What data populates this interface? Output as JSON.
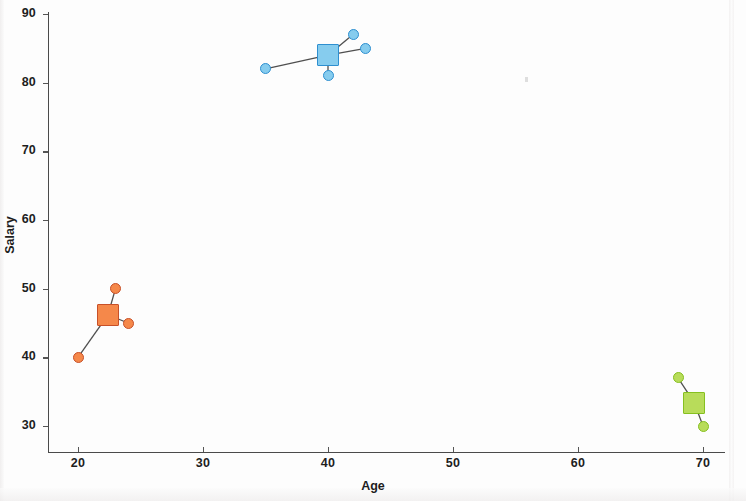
{
  "chart_data": {
    "type": "scatter",
    "title": "",
    "xlabel": "Age",
    "ylabel": "Salary",
    "xlim": [
      17.6,
      72.2
    ],
    "ylim": [
      28.0,
      90.9
    ],
    "xticks": [
      20,
      30,
      40,
      50,
      60,
      70
    ],
    "yticks": [
      30,
      40,
      50,
      60,
      70,
      80,
      90
    ],
    "grid": false,
    "legend": null,
    "series": [
      {
        "name": "cluster-orange",
        "color": "#F5884A",
        "edge_color": "#C85028",
        "points": [
          {
            "x": 20,
            "y": 40
          },
          {
            "x": 23,
            "y": 50
          },
          {
            "x": 24,
            "y": 45
          }
        ],
        "centroid": {
          "x": 22.4,
          "y": 46.2
        }
      },
      {
        "name": "cluster-blue",
        "color": "#86CCEE",
        "edge_color": "#2E8FD0",
        "points": [
          {
            "x": 35,
            "y": 82
          },
          {
            "x": 40,
            "y": 81
          },
          {
            "x": 42,
            "y": 87
          },
          {
            "x": 43,
            "y": 85
          }
        ],
        "centroid": {
          "x": 40.0,
          "y": 84.0
        }
      },
      {
        "name": "cluster-green",
        "color": "#B8DC5A",
        "edge_color": "#86C020",
        "points": [
          {
            "x": 68,
            "y": 37
          },
          {
            "x": 70,
            "y": 30
          }
        ],
        "centroid": {
          "x": 69.3,
          "y": 33.4
        }
      }
    ]
  },
  "axes": {
    "x_title": "Age",
    "y_title": "Salary",
    "x_tick_labels": [
      "20",
      "30",
      "40",
      "50",
      "60",
      "70"
    ],
    "y_tick_labels": [
      "30",
      "40",
      "50",
      "60",
      "70",
      "80",
      "90"
    ]
  },
  "colors": {
    "axis": "#4a4a4a",
    "text": "#1e1e1e",
    "background": "#fdfdfd",
    "link": "#4f4f4f"
  }
}
